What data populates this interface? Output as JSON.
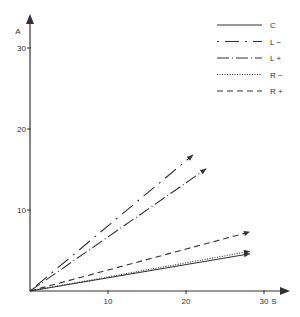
{
  "chart_data": {
    "type": "line",
    "title": "",
    "xlabel": "S",
    "ylabel": "A",
    "xlim": [
      0,
      31
    ],
    "ylim": [
      0,
      32
    ],
    "xticks": [
      10,
      20,
      30
    ],
    "yticks": [
      10,
      20,
      30
    ],
    "grid": false,
    "legend_position": "upper right",
    "series": [
      {
        "name": "C",
        "style": "solid",
        "x": [
          0,
          28.2
        ],
        "y": [
          0,
          4.6
        ]
      },
      {
        "name": "L −",
        "style": "long-dash-dot",
        "x": [
          0,
          20.9
        ],
        "y": [
          0,
          16.8
        ]
      },
      {
        "name": "L +",
        "style": "dash-dot",
        "x": [
          0,
          22.6
        ],
        "y": [
          0,
          15.1
        ]
      },
      {
        "name": "R −",
        "style": "dotted",
        "x": [
          0,
          28.2
        ],
        "y": [
          0,
          4.9
        ]
      },
      {
        "name": "R +",
        "style": "dashed",
        "x": [
          0,
          28.2
        ],
        "y": [
          0,
          7.3
        ]
      }
    ]
  },
  "axis": {
    "x_label": "S",
    "y_label": "A",
    "x_ticks": [
      "10",
      "20",
      "30"
    ],
    "y_ticks": [
      "10",
      "20",
      "30"
    ]
  },
  "legend": [
    {
      "label": "C",
      "dash": ""
    },
    {
      "label": "L −",
      "dash": "2 6 14 6"
    },
    {
      "label": "L +",
      "dash": "12 3 1 3"
    },
    {
      "label": "R −",
      "dash": "1 1.5"
    },
    {
      "label": "R +",
      "dash": "6 4"
    }
  ],
  "colors": {
    "ink": "#333333",
    "background": "#ffffff"
  }
}
